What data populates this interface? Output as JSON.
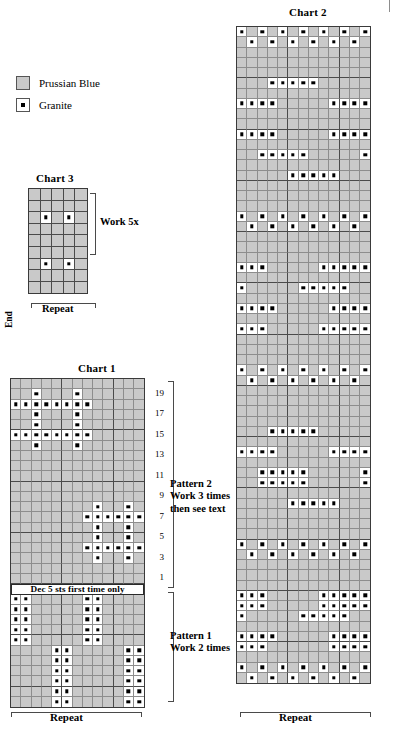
{
  "legend": {
    "items": [
      {
        "label": "Prussian Blue",
        "symbol": "plain-square",
        "color": "#c9c9c9"
      },
      {
        "label": "Granite",
        "symbol": "dotted-square",
        "color": "#ffffff"
      }
    ]
  },
  "charts": {
    "chart1": {
      "title": "Chart 1",
      "cols": 13,
      "rows": 32,
      "repeat_label": "Repeat",
      "banner_text": "Dec 5 sts first time only",
      "banner_after_row": 21,
      "row_numbers": [
        "1",
        "3",
        "5",
        "7",
        "9",
        "11",
        "13",
        "15",
        "17",
        "19"
      ],
      "sections": [
        {
          "name": "Pattern 2",
          "lines": [
            "Pattern 2",
            "Work 3 times",
            "then see text"
          ]
        },
        {
          "name": "Pattern 1",
          "lines": [
            "Pattern 1",
            "Work 2 times"
          ]
        }
      ],
      "granite_cells": [
        [
          2,
          3
        ],
        [
          2,
          7
        ],
        [
          3,
          1
        ],
        [
          3,
          2
        ],
        [
          3,
          3
        ],
        [
          3,
          4
        ],
        [
          3,
          5
        ],
        [
          3,
          6
        ],
        [
          3,
          7
        ],
        [
          3,
          8
        ],
        [
          4,
          3
        ],
        [
          4,
          7
        ],
        [
          5,
          3
        ],
        [
          5,
          7
        ],
        [
          6,
          1
        ],
        [
          6,
          2
        ],
        [
          6,
          3
        ],
        [
          6,
          4
        ],
        [
          6,
          5
        ],
        [
          6,
          6
        ],
        [
          6,
          7
        ],
        [
          6,
          8
        ],
        [
          7,
          3
        ],
        [
          7,
          7
        ],
        [
          13,
          9
        ],
        [
          13,
          12
        ],
        [
          14,
          8
        ],
        [
          14,
          9
        ],
        [
          14,
          10
        ],
        [
          14,
          11
        ],
        [
          14,
          12
        ],
        [
          14,
          13
        ],
        [
          15,
          9
        ],
        [
          15,
          12
        ],
        [
          16,
          9
        ],
        [
          16,
          12
        ],
        [
          17,
          8
        ],
        [
          17,
          9
        ],
        [
          17,
          10
        ],
        [
          17,
          11
        ],
        [
          17,
          12
        ],
        [
          17,
          13
        ],
        [
          18,
          9
        ],
        [
          18,
          12
        ],
        [
          22,
          1
        ],
        [
          22,
          2
        ],
        [
          22,
          8
        ],
        [
          22,
          9
        ],
        [
          23,
          1
        ],
        [
          23,
          2
        ],
        [
          23,
          8
        ],
        [
          23,
          9
        ],
        [
          24,
          1
        ],
        [
          24,
          2
        ],
        [
          24,
          8
        ],
        [
          24,
          9
        ],
        [
          25,
          1
        ],
        [
          25,
          2
        ],
        [
          25,
          8
        ],
        [
          25,
          9
        ],
        [
          26,
          1
        ],
        [
          26,
          2
        ],
        [
          26,
          8
        ],
        [
          26,
          9
        ],
        [
          27,
          5
        ],
        [
          27,
          6
        ],
        [
          27,
          12
        ],
        [
          27,
          13
        ],
        [
          28,
          5
        ],
        [
          28,
          6
        ],
        [
          28,
          12
        ],
        [
          28,
          13
        ],
        [
          29,
          5
        ],
        [
          29,
          6
        ],
        [
          29,
          12
        ],
        [
          29,
          13
        ],
        [
          30,
          5
        ],
        [
          30,
          6
        ],
        [
          30,
          12
        ],
        [
          30,
          13
        ],
        [
          31,
          5
        ],
        [
          31,
          6
        ],
        [
          31,
          12
        ],
        [
          31,
          13
        ],
        [
          32,
          5
        ],
        [
          32,
          6
        ],
        [
          32,
          12
        ],
        [
          32,
          13
        ]
      ]
    },
    "chart2": {
      "title": "Chart 2",
      "cols": 13,
      "rows": 64,
      "repeat_label": "Repeat",
      "granite_cells": [
        [
          1,
          1
        ],
        [
          1,
          3
        ],
        [
          1,
          5
        ],
        [
          1,
          7
        ],
        [
          1,
          9
        ],
        [
          1,
          11
        ],
        [
          1,
          13
        ],
        [
          2,
          2
        ],
        [
          2,
          4
        ],
        [
          2,
          6
        ],
        [
          2,
          8
        ],
        [
          2,
          10
        ],
        [
          2,
          12
        ],
        [
          6,
          4
        ],
        [
          6,
          5
        ],
        [
          6,
          6
        ],
        [
          6,
          7
        ],
        [
          6,
          8
        ],
        [
          8,
          1
        ],
        [
          8,
          2
        ],
        [
          8,
          3
        ],
        [
          8,
          4
        ],
        [
          8,
          10
        ],
        [
          8,
          11
        ],
        [
          8,
          12
        ],
        [
          8,
          13
        ],
        [
          11,
          1
        ],
        [
          11,
          2
        ],
        [
          11,
          3
        ],
        [
          11,
          4
        ],
        [
          11,
          10
        ],
        [
          11,
          11
        ],
        [
          11,
          12
        ],
        [
          11,
          13
        ],
        [
          13,
          3
        ],
        [
          13,
          4
        ],
        [
          13,
          5
        ],
        [
          13,
          6
        ],
        [
          13,
          7
        ],
        [
          13,
          13
        ],
        [
          15,
          6
        ],
        [
          15,
          7
        ],
        [
          15,
          8
        ],
        [
          15,
          9
        ],
        [
          15,
          10
        ],
        [
          19,
          1
        ],
        [
          19,
          3
        ],
        [
          19,
          5
        ],
        [
          19,
          7
        ],
        [
          19,
          9
        ],
        [
          19,
          11
        ],
        [
          19,
          13
        ],
        [
          20,
          2
        ],
        [
          20,
          4
        ],
        [
          20,
          6
        ],
        [
          20,
          8
        ],
        [
          20,
          10
        ],
        [
          20,
          12
        ],
        [
          24,
          1
        ],
        [
          24,
          2
        ],
        [
          24,
          3
        ],
        [
          24,
          9
        ],
        [
          24,
          10
        ],
        [
          24,
          11
        ],
        [
          24,
          12
        ],
        [
          24,
          13
        ],
        [
          26,
          1
        ],
        [
          26,
          7
        ],
        [
          26,
          8
        ],
        [
          26,
          9
        ],
        [
          26,
          10
        ],
        [
          26,
          11
        ],
        [
          28,
          1
        ],
        [
          28,
          2
        ],
        [
          28,
          3
        ],
        [
          28,
          4
        ],
        [
          28,
          10
        ],
        [
          28,
          11
        ],
        [
          28,
          12
        ],
        [
          28,
          13
        ],
        [
          30,
          1
        ],
        [
          30,
          2
        ],
        [
          30,
          3
        ],
        [
          30,
          9
        ],
        [
          30,
          10
        ],
        [
          30,
          11
        ],
        [
          30,
          12
        ],
        [
          30,
          13
        ],
        [
          34,
          1
        ],
        [
          34,
          3
        ],
        [
          34,
          5
        ],
        [
          34,
          7
        ],
        [
          34,
          9
        ],
        [
          34,
          11
        ],
        [
          34,
          13
        ],
        [
          35,
          2
        ],
        [
          35,
          4
        ],
        [
          35,
          6
        ],
        [
          35,
          8
        ],
        [
          35,
          10
        ],
        [
          35,
          12
        ],
        [
          40,
          4
        ],
        [
          40,
          5
        ],
        [
          40,
          6
        ],
        [
          40,
          7
        ],
        [
          40,
          8
        ],
        [
          42,
          1
        ],
        [
          42,
          2
        ],
        [
          42,
          3
        ],
        [
          42,
          4
        ],
        [
          42,
          10
        ],
        [
          42,
          11
        ],
        [
          42,
          12
        ],
        [
          42,
          13
        ],
        [
          44,
          3
        ],
        [
          44,
          4
        ],
        [
          44,
          5
        ],
        [
          44,
          6
        ],
        [
          44,
          7
        ],
        [
          44,
          13
        ],
        [
          45,
          3
        ],
        [
          45,
          4
        ],
        [
          45,
          5
        ],
        [
          45,
          6
        ],
        [
          45,
          7
        ],
        [
          45,
          13
        ],
        [
          47,
          6
        ],
        [
          47,
          7
        ],
        [
          47,
          8
        ],
        [
          47,
          9
        ],
        [
          47,
          10
        ],
        [
          51,
          1
        ],
        [
          51,
          3
        ],
        [
          51,
          5
        ],
        [
          51,
          7
        ],
        [
          51,
          9
        ],
        [
          51,
          11
        ],
        [
          51,
          13
        ],
        [
          52,
          2
        ],
        [
          52,
          4
        ],
        [
          52,
          6
        ],
        [
          52,
          8
        ],
        [
          52,
          10
        ],
        [
          52,
          12
        ],
        [
          56,
          1
        ],
        [
          56,
          2
        ],
        [
          56,
          3
        ],
        [
          56,
          9
        ],
        [
          56,
          10
        ],
        [
          56,
          11
        ],
        [
          56,
          12
        ],
        [
          56,
          13
        ],
        [
          57,
          1
        ],
        [
          57,
          2
        ],
        [
          57,
          3
        ],
        [
          57,
          9
        ],
        [
          57,
          10
        ],
        [
          57,
          11
        ],
        [
          57,
          12
        ],
        [
          57,
          13
        ],
        [
          58,
          1
        ],
        [
          58,
          7
        ],
        [
          58,
          8
        ],
        [
          58,
          9
        ],
        [
          58,
          10
        ],
        [
          58,
          11
        ],
        [
          60,
          1
        ],
        [
          60,
          2
        ],
        [
          60,
          3
        ],
        [
          60,
          4
        ],
        [
          60,
          10
        ],
        [
          60,
          11
        ],
        [
          60,
          12
        ],
        [
          60,
          13
        ],
        [
          61,
          1
        ],
        [
          61,
          2
        ],
        [
          61,
          3
        ],
        [
          61,
          10
        ],
        [
          61,
          11
        ],
        [
          61,
          12
        ],
        [
          61,
          13
        ],
        [
          63,
          1
        ],
        [
          63,
          3
        ],
        [
          63,
          5
        ],
        [
          63,
          7
        ],
        [
          63,
          9
        ],
        [
          63,
          11
        ],
        [
          63,
          13
        ],
        [
          64,
          2
        ],
        [
          64,
          4
        ],
        [
          64,
          6
        ],
        [
          64,
          8
        ],
        [
          64,
          10
        ],
        [
          64,
          12
        ]
      ]
    },
    "chart3": {
      "title": "Chart 3",
      "cols": 5,
      "rows": 9,
      "repeat_label": "Repeat",
      "end_label": "End",
      "work_label": "Work 5x",
      "granite_cells": [
        [
          3,
          2
        ],
        [
          3,
          4
        ],
        [
          7,
          2
        ],
        [
          7,
          4
        ]
      ]
    }
  }
}
